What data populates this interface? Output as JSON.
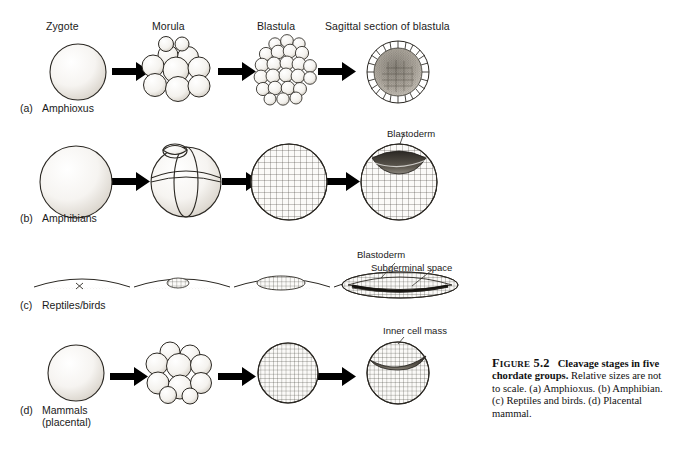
{
  "figure": {
    "columns": [
      {
        "label": "Zygote",
        "x": 46,
        "y": 20
      },
      {
        "label": "Morula",
        "x": 152,
        "y": 20
      },
      {
        "label": "Blastula",
        "x": 257,
        "y": 20
      },
      {
        "label": "Sagittal section of blastula",
        "x": 325,
        "y": 20
      }
    ],
    "rows": [
      {
        "letter": "(a)",
        "name": "Amphioxus",
        "sub": "",
        "label_x": 20,
        "label_y": 102
      },
      {
        "letter": "(b)",
        "name": "Amphibians",
        "sub": "",
        "label_x": 20,
        "label_y": 212
      },
      {
        "letter": "(c)",
        "name": "Reptiles/birds",
        "sub": "",
        "label_x": 20,
        "label_y": 299
      },
      {
        "letter": "(d)",
        "name": "Mammals",
        "sub": "(placental)",
        "label_x": 20,
        "label_y": 404
      }
    ],
    "callouts": [
      {
        "text": "Blastoderm",
        "x": 387,
        "y": 128
      },
      {
        "text": "Blastoderm",
        "x": 357,
        "y": 249
      },
      {
        "text": "Subgerminal space",
        "x": 371,
        "y": 262
      },
      {
        "text": "Inner cell mass",
        "x": 383,
        "y": 325
      }
    ],
    "colors": {
      "ink": "#1a1a1a",
      "line": "#222222",
      "background": "#ffffff",
      "shade_light": "#f2f0ec",
      "shade_mid": "#cfcac2",
      "shade_dark": "#4a4640"
    }
  },
  "caption": {
    "figure_number": "Figure 5.2",
    "title": "Cleavage stages in five chordate groups.",
    "body": "Relative sizes are not to scale. (a) Amphioxus. (b) Amphibian. (c) Reptiles and birds. (d) Placental mammal."
  }
}
